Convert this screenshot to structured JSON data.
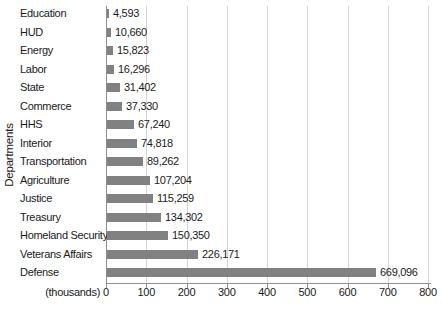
{
  "chart_data": {
    "type": "bar",
    "orientation": "horizontal",
    "title": "",
    "ylabel": "Departments",
    "x_unit_label": "(thousands)",
    "x_ticks": [
      "0",
      "100",
      "200",
      "300",
      "400",
      "500",
      "600",
      "700",
      "800"
    ],
    "xlim": [
      0,
      800
    ],
    "grid": true,
    "legend": false,
    "categories": [
      "Education",
      "HUD",
      "Energy",
      "Labor",
      "State",
      "Commerce",
      "HHS",
      "Interior",
      "Transportation",
      "Agriculture",
      "Justice",
      "Treasury",
      "Homeland Security",
      "Veterans Affairs",
      "Defense"
    ],
    "values": [
      4593,
      10660,
      15823,
      16296,
      31402,
      37330,
      67240,
      74818,
      89262,
      107204,
      115259,
      134302,
      150350,
      226171,
      669096
    ],
    "value_labels": [
      "4,593",
      "10,660",
      "15,823",
      "16,296",
      "31,402",
      "37,330",
      "67,240",
      "74,818",
      "89,262",
      "107,204",
      "115,259",
      "134,302",
      "150,350",
      "226,171",
      "669,096"
    ],
    "colors": {
      "bar": "#818181",
      "gridline": "#d5d5d5",
      "axis": "#8e8e8e",
      "text": "#1a1a1a"
    }
  }
}
